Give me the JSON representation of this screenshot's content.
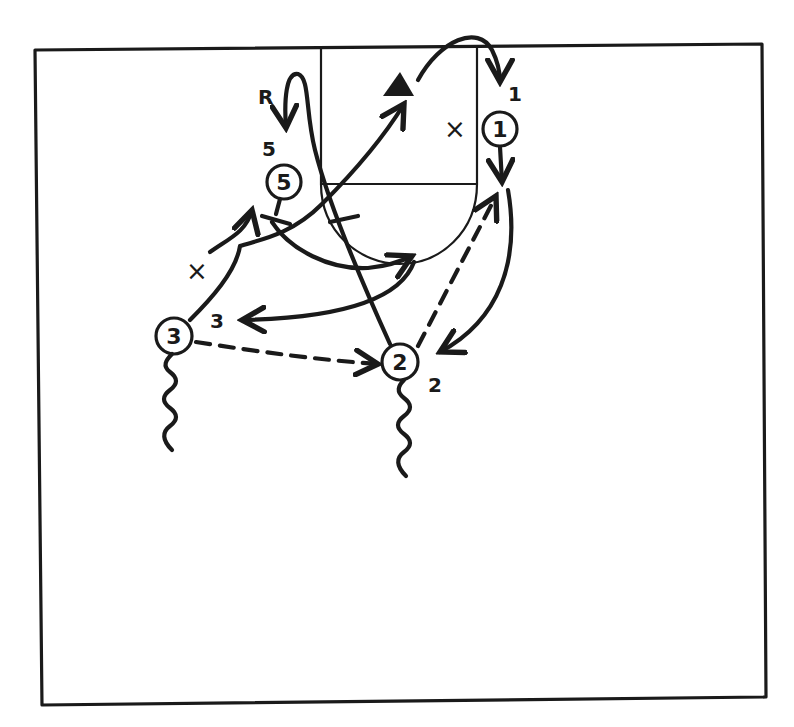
{
  "diagram": {
    "type": "basketball-play-diagram",
    "court": "half-court",
    "ink_color": "#1a1a1a",
    "background_color": "#ffffff"
  },
  "players": [
    {
      "id": "1",
      "label": "1",
      "role": "offense"
    },
    {
      "id": "2",
      "label": "2",
      "role": "offense"
    },
    {
      "id": "3",
      "label": "3",
      "role": "offense"
    },
    {
      "id": "5",
      "label": "5",
      "role": "offense"
    }
  ],
  "basket_marker": {
    "label": "▲",
    "meaning": "basket / shot"
  },
  "screen_marks": [
    {
      "label": "×",
      "location": "inside lane"
    },
    {
      "label": "×",
      "location": "left wing cut"
    }
  ],
  "position_labels": [
    {
      "label": "1",
      "near": "right block"
    },
    {
      "label": "2",
      "near": "right wing"
    },
    {
      "label": "3",
      "near": "left wing"
    },
    {
      "label": "5",
      "near": "left elbow"
    },
    {
      "label": "R",
      "near": "left block",
      "meaning": "rebound"
    }
  ],
  "legend": {
    "solid_arrow": "cut / movement",
    "dashed_arrow": "pass",
    "wavy_line": "dribble",
    "bar_end": "screen"
  }
}
